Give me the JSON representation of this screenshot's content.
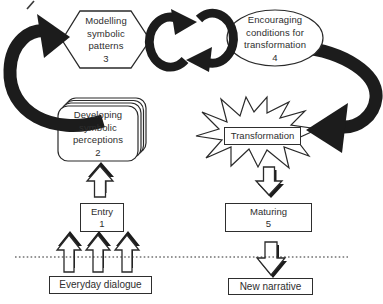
{
  "palette": {
    "ink": "#1c1c1c",
    "paper": "#ffffff",
    "text": "#2e2e2e"
  },
  "nodes": {
    "modelling": {
      "shape": "hexagon",
      "lines": [
        "Modelling",
        "symbolic",
        "patterns"
      ],
      "number": "3"
    },
    "encouraging": {
      "shape": "ellipse",
      "lines": [
        "Encouraging",
        "conditions for",
        "transformation"
      ],
      "number": "4"
    },
    "developing": {
      "shape": "stacked-cards",
      "lines": [
        "Developing",
        "symbolic",
        "perceptions"
      ],
      "number": "2"
    },
    "transformation": {
      "shape": "starburst",
      "label": "Transformation"
    },
    "entry": {
      "shape": "rectangle",
      "label": "Entry",
      "number": "1"
    },
    "maturing": {
      "shape": "rectangle",
      "label": "Maturing",
      "number": "5"
    },
    "everyday_dialogue": {
      "shape": "rectangle",
      "label": "Everyday dialogue"
    },
    "new_narrative": {
      "shape": "rectangle",
      "label": "New narrative"
    }
  },
  "arrows": [
    {
      "name": "curved-arrow-developing-to-modelling",
      "style": "thick-solid-curve",
      "from": "developing",
      "to": "modelling"
    },
    {
      "name": "cycle-arrow-modelling-to-encouraging",
      "style": "thick-solid-curve",
      "from": "modelling",
      "to": "encouraging"
    },
    {
      "name": "cycle-arrow-encouraging-to-modelling",
      "style": "thick-solid-curve",
      "from": "encouraging",
      "to": "modelling"
    },
    {
      "name": "curved-arrow-encouraging-to-transformation",
      "style": "thick-solid-curve",
      "from": "encouraging",
      "to": "transformation"
    },
    {
      "name": "up-arrow-entry-to-developing",
      "style": "hollow-3d-up",
      "from": "entry",
      "to": "developing"
    },
    {
      "name": "up-arrows-dialogue-to-entry",
      "style": "hollow-3d-up",
      "count": 3,
      "from": "everyday_dialogue",
      "to": "entry"
    },
    {
      "name": "down-arrow-transformation-to-maturing",
      "style": "hollow-3d-down",
      "from": "transformation",
      "to": "maturing"
    },
    {
      "name": "down-arrow-maturing-to-new-narrative",
      "style": "hollow-3d-down",
      "from": "maturing",
      "to": "new_narrative"
    }
  ],
  "divider": {
    "style": "dotted-horizontal-line"
  }
}
